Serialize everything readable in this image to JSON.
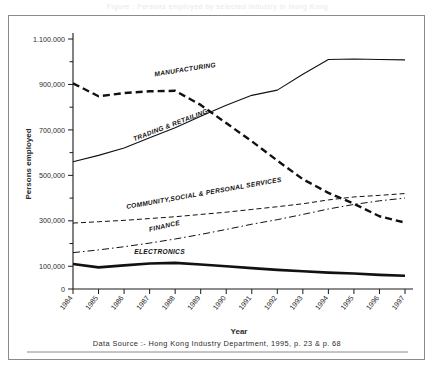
{
  "caption": "Figure : Persons employed by selected industry in Hong Kong",
  "frame": {
    "border_color": "#8a8a8a"
  },
  "source_note": "Data Source :-  Hong Kong Industry Department, 1995, p. 23 & p. 68",
  "chart_data": {
    "type": "line",
    "title": "",
    "xlabel": "Year",
    "ylabel": "Persons employed",
    "x": [
      "1984",
      "1985",
      "1986",
      "1987",
      "1988",
      "1989",
      "1990",
      "1991",
      "1992",
      "1993",
      "1994",
      "1995",
      "1996",
      "1997"
    ],
    "xlim": [
      1984,
      1997
    ],
    "ylim": [
      0,
      1100000
    ],
    "ytick_labels": [
      "0",
      "100,000",
      "300,000",
      "500,000",
      "700,000",
      "900,000",
      "1.100.000"
    ],
    "ytick_values": [
      0,
      100000,
      300000,
      500000,
      700000,
      900000,
      1100000
    ],
    "yminor_values": [
      200000,
      400000,
      600000,
      800000,
      1000000
    ],
    "grid": false,
    "legend": "inline-labels",
    "series": [
      {
        "name": "MANUFACTURING",
        "style": "bold-dashed",
        "color": "#111111",
        "width": 2.4,
        "dash": "7,4",
        "label_x": 1987.2,
        "label_y": 935000,
        "label_rotate": -9,
        "values": [
          905000,
          848000,
          862000,
          870000,
          872000,
          810000,
          730000,
          650000,
          565000,
          483000,
          423000,
          375000,
          320000,
          292000
        ]
      },
      {
        "name": "TRADING & RETAILING",
        "style": "thin-solid",
        "color": "#111111",
        "width": 1.1,
        "dash": "none",
        "label_x": 1986.4,
        "label_y": 650000,
        "label_rotate": -21,
        "values": [
          560000,
          588000,
          620000,
          665000,
          710000,
          760000,
          808000,
          852000,
          875000,
          945000,
          1010000,
          1012000,
          1010000,
          1008000
        ]
      },
      {
        "name": "COMMUNITY,SOCIAL & PERSONAL SERVICES",
        "style": "thin-dashed",
        "color": "#111111",
        "width": 1.0,
        "dash": "5,3",
        "label_x": 1986.1,
        "label_y": 352000,
        "label_rotate": -10,
        "values": [
          290000,
          296000,
          302000,
          310000,
          318000,
          328000,
          338000,
          350000,
          362000,
          375000,
          392000,
          405000,
          412000,
          420000
        ]
      },
      {
        "name": "FINANCE",
        "style": "dash-dot",
        "color": "#111111",
        "width": 1.0,
        "dash": "7,3,1.6,3",
        "label_x": 1987.0,
        "label_y": 252000,
        "label_rotate": -13,
        "values": [
          160000,
          172000,
          186000,
          202000,
          220000,
          240000,
          262000,
          285000,
          305000,
          328000,
          352000,
          372000,
          388000,
          400000
        ]
      },
      {
        "name": "ELECTRONICS",
        "style": "thick-solid",
        "color": "#111111",
        "width": 2.6,
        "dash": "none",
        "label_x": 1986.4,
        "label_y": 152000,
        "label_rotate": 0,
        "values": [
          110000,
          95000,
          104000,
          112000,
          115000,
          108000,
          100000,
          92000,
          84000,
          78000,
          72000,
          68000,
          62000,
          58000
        ]
      }
    ]
  }
}
